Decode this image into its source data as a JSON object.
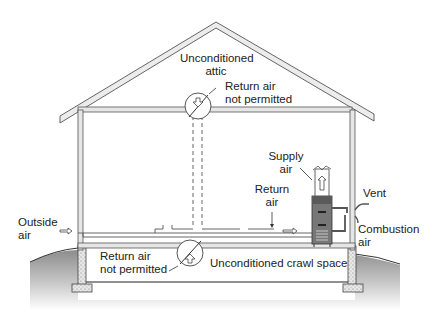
{
  "labels": {
    "attic": [
      "Unconditioned",
      "attic"
    ],
    "attic_return": [
      "Return air",
      "not permitted"
    ],
    "supply": [
      "Supply",
      "air"
    ],
    "return": [
      "Return",
      "air"
    ],
    "vent": "Vent",
    "outside": [
      "Outside",
      "air"
    ],
    "combustion": [
      "Combustion",
      "air"
    ],
    "crawl_return": [
      "Return air",
      "not permitted"
    ],
    "crawl": "Unconditioned crawl space"
  },
  "icons": {
    "no_return_symbol": "circle-with-slash",
    "arrow": "hollow-arrow"
  },
  "colors": {
    "line": "#555555",
    "wall_fill": "#e6e6e6",
    "ground_dark": "#8a8a8a",
    "ground_light": "#f2f2f2",
    "furnace": "#6e6e6e"
  }
}
